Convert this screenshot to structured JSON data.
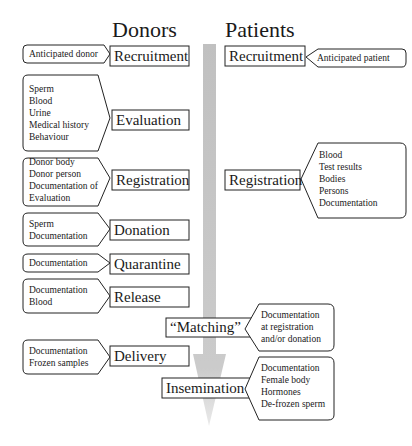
{
  "headings": {
    "donors": "Donors",
    "patients": "Patients"
  },
  "donor_stages": [
    {
      "label": "Recruitment",
      "items": [
        "Anticipated donor"
      ]
    },
    {
      "label": "Evaluation",
      "items": [
        "Sperm",
        "Blood",
        "Urine",
        "Medical history",
        "Behaviour"
      ]
    },
    {
      "label": "Registration",
      "items": [
        "Donor body",
        "Donor person",
        "Documentation of",
        "Evaluation"
      ]
    },
    {
      "label": "Donation",
      "items": [
        "Sperm",
        "Documentation"
      ]
    },
    {
      "label": "Quarantine",
      "items": [
        "Documentation"
      ]
    },
    {
      "label": "Release",
      "items": [
        "Documentation",
        "Blood"
      ]
    },
    {
      "label": "Delivery",
      "items": [
        "Documentation",
        "Frozen samples"
      ]
    }
  ],
  "patient_stages": [
    {
      "label": "Recruitment",
      "items": [
        "Anticipated patient"
      ]
    },
    {
      "label": "Registration",
      "items": [
        "Blood",
        "Test results",
        "Bodies",
        "Persons",
        "Documentation"
      ]
    },
    {
      "label": "“Matching”",
      "items": [
        "Documentation",
        "at registration",
        "and/or donation"
      ]
    },
    {
      "label": "Insemination",
      "items": [
        "Documentation",
        "Female body",
        "Hormones",
        "De-frozen sperm"
      ]
    }
  ],
  "colors": {
    "arrow": "#b8b8b8",
    "stroke": "#222222"
  }
}
